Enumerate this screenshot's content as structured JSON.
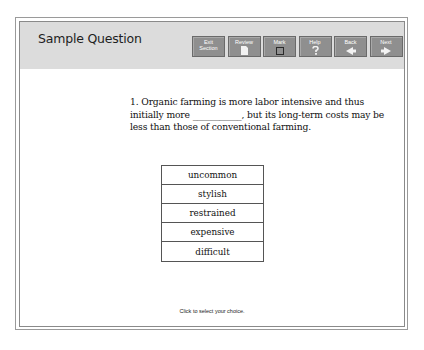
{
  "header": {
    "title": "Sample Question"
  },
  "toolbar": {
    "buttons": [
      {
        "id": "exit-section",
        "label": "Exit\nSection",
        "icon": "none"
      },
      {
        "id": "review",
        "label": "Review",
        "icon": "document-icon"
      },
      {
        "id": "mark",
        "label": "Mark",
        "icon": "checkbox-icon"
      },
      {
        "id": "help",
        "label": "Help",
        "icon": "question-mark-icon"
      },
      {
        "id": "back",
        "label": "Back",
        "icon": "arrow-left-icon"
      },
      {
        "id": "next",
        "label": "Next",
        "icon": "arrow-right-icon"
      }
    ],
    "colors": {
      "button_bg": "#8f8f8f",
      "header_bg": "#dcdcdc",
      "label": "#ffffff"
    }
  },
  "question": {
    "number": "1.",
    "text_before_blank": "Organic farming is more labor intensive and thus initially more",
    "blank": "___________",
    "text_after_blank": ", but its long-term costs may be less than those of conventional farming."
  },
  "choices": [
    {
      "label": "uncommon"
    },
    {
      "label": "stylish"
    },
    {
      "label": "restrained"
    },
    {
      "label": "expensive"
    },
    {
      "label": "difficult"
    }
  ],
  "footer": {
    "instruction": "Click to select your choice."
  }
}
